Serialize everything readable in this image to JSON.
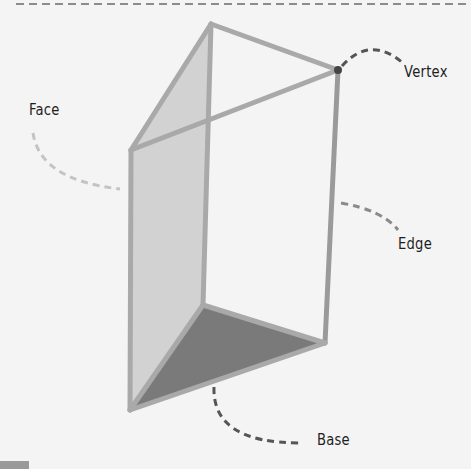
{
  "diagram": {
    "labels": {
      "vertex": "Vertex",
      "face": "Face",
      "edge": "Edge",
      "base": "Base"
    },
    "colors": {
      "background": "#f4f4f4",
      "edge_line": "#a9a9a9",
      "face_fill": "#d2d2d2",
      "base_fill": "#7a7a7a",
      "vertex_dot": "#444444",
      "leader_dark": "#555555",
      "leader_light": "#c4c4c4",
      "label_text": "#1e1e1e"
    }
  }
}
